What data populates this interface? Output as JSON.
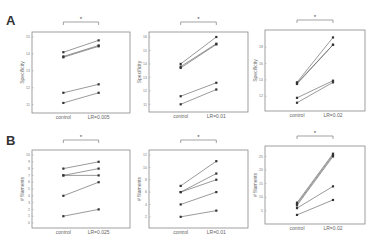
{
  "figure": {
    "panel_labels": [
      "A",
      "B"
    ]
  },
  "chart_data": [
    {
      "id": "A1",
      "type": "line",
      "row": "A",
      "title": "",
      "xlabel": "",
      "ylabel": "Specificity",
      "categories": [
        "control",
        "LR=0.005"
      ],
      "yticks": [
        "11",
        "12",
        "13",
        "14",
        "15"
      ],
      "ylim": [
        10.8,
        15.0
      ],
      "series": [
        {
          "name": "s1",
          "values": [
            14.1,
            14.8
          ]
        },
        {
          "name": "s2",
          "values": [
            13.85,
            14.5
          ]
        },
        {
          "name": "s3",
          "values": [
            13.8,
            14.45
          ]
        },
        {
          "name": "s4",
          "values": [
            11.7,
            12.2
          ]
        },
        {
          "name": "s5",
          "values": [
            11.1,
            11.7
          ]
        }
      ],
      "significance": {
        "label": "*",
        "between": [
          "control",
          "LR=0.005"
        ]
      },
      "grid": false
    },
    {
      "id": "A2",
      "type": "line",
      "row": "A",
      "title": "",
      "xlabel": "",
      "ylabel": "Specificity",
      "categories": [
        "control",
        "LR=0.01"
      ],
      "yticks": [
        "11",
        "12",
        "13",
        "14",
        "15",
        "16"
      ],
      "ylim": [
        10.8,
        16.0
      ],
      "series": [
        {
          "name": "s1",
          "values": [
            14.0,
            16.0
          ]
        },
        {
          "name": "s2",
          "values": [
            13.8,
            15.5
          ]
        },
        {
          "name": "s3",
          "values": [
            13.7,
            15.45
          ]
        },
        {
          "name": "s4",
          "values": [
            11.6,
            12.6
          ]
        },
        {
          "name": "s5",
          "values": [
            11.0,
            12.1
          ]
        }
      ],
      "significance": {
        "label": "*",
        "between": [
          "control",
          "LR=0.01"
        ]
      },
      "grid": false
    },
    {
      "id": "A3",
      "type": "line",
      "row": "A",
      "title": "",
      "xlabel": "",
      "ylabel": "Specificity",
      "categories": [
        "control",
        "LR=0.02"
      ],
      "yticks": [
        "12",
        "14",
        "16",
        "18"
      ],
      "ylim": [
        10.8,
        19.5
      ],
      "series": [
        {
          "name": "s1",
          "values": [
            13.7,
            19.2
          ]
        },
        {
          "name": "s2",
          "values": [
            13.6,
            18.3
          ]
        },
        {
          "name": "s3",
          "values": [
            13.5,
            18.3
          ]
        },
        {
          "name": "s4",
          "values": [
            11.8,
            13.9
          ]
        },
        {
          "name": "s5",
          "values": [
            11.2,
            13.7
          ]
        }
      ],
      "significance": {
        "label": "*",
        "between": [
          "control",
          "LR=0.02"
        ]
      },
      "grid": false
    },
    {
      "id": "B1",
      "type": "line",
      "row": "B",
      "title": "",
      "xlabel": "",
      "ylabel": "# filaments",
      "categories": [
        "control",
        "LR=0.025"
      ],
      "yticks": [
        "0",
        "1",
        "2",
        "3",
        "4",
        "5",
        "6",
        "7",
        "8",
        "9",
        "10"
      ],
      "ylim": [
        0,
        10
      ],
      "series": [
        {
          "name": "s1",
          "values": [
            8,
            9
          ]
        },
        {
          "name": "s2",
          "values": [
            7,
            8
          ]
        },
        {
          "name": "s3",
          "values": [
            7,
            7
          ]
        },
        {
          "name": "s4",
          "values": [
            4,
            6
          ]
        },
        {
          "name": "s5",
          "values": [
            1,
            2
          ]
        }
      ],
      "significance": {
        "label": "*",
        "between": [
          "control",
          "LR=0.025"
        ]
      },
      "grid": false
    },
    {
      "id": "B2",
      "type": "line",
      "row": "B",
      "title": "",
      "xlabel": "",
      "ylabel": "# filaments",
      "categories": [
        "control",
        "LR=0.01"
      ],
      "yticks": [
        "2",
        "4",
        "6",
        "8",
        "10",
        "12"
      ],
      "ylim": [
        1,
        12
      ],
      "series": [
        {
          "name": "s1",
          "values": [
            7,
            11
          ]
        },
        {
          "name": "s2",
          "values": [
            6,
            9
          ]
        },
        {
          "name": "s3",
          "values": [
            6,
            8
          ]
        },
        {
          "name": "s4",
          "values": [
            4,
            6
          ]
        },
        {
          "name": "s5",
          "values": [
            2,
            3
          ]
        }
      ],
      "significance": {
        "label": "*",
        "between": [
          "control",
          "LR=0.01"
        ]
      },
      "grid": false
    },
    {
      "id": "B3",
      "type": "line",
      "row": "B",
      "title": "",
      "xlabel": "",
      "ylabel": "# filaments",
      "categories": [
        "control",
        "LR=0.02"
      ],
      "yticks": [
        "5",
        "10",
        "15",
        "20",
        "25"
      ],
      "ylim": [
        2,
        27
      ],
      "series": [
        {
          "name": "s1",
          "values": [
            8,
            26
          ]
        },
        {
          "name": "s2",
          "values": [
            7.5,
            25.5
          ]
        },
        {
          "name": "s3",
          "values": [
            7,
            25
          ]
        },
        {
          "name": "s4",
          "values": [
            6,
            14
          ]
        },
        {
          "name": "s5",
          "values": [
            3.5,
            9
          ]
        }
      ],
      "significance": {
        "label": "*",
        "between": [
          "control",
          "LR=0.02"
        ]
      },
      "grid": false
    }
  ]
}
